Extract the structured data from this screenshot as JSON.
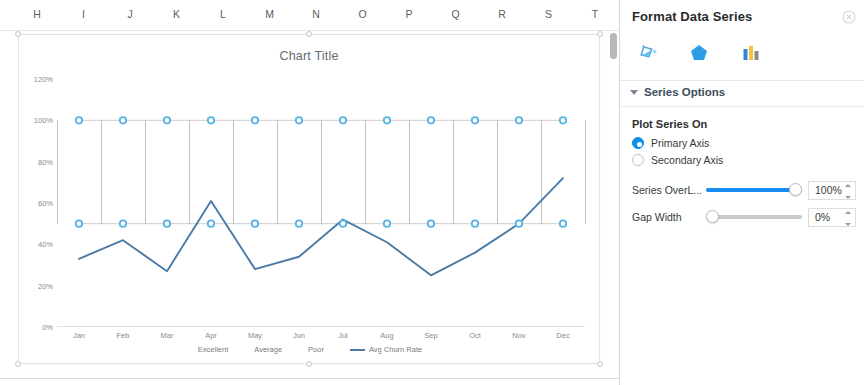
{
  "spreadsheet": {
    "column_headers": [
      "H",
      "I",
      "J",
      "K",
      "L",
      "M",
      "N",
      "O",
      "P",
      "Q",
      "R",
      "S",
      "T"
    ]
  },
  "chart_data": {
    "type": "line",
    "title": "Chart Title",
    "xlabel": "",
    "ylabel": "",
    "ylim": [
      0,
      120
    ],
    "ytick_labels": [
      "0%",
      "20%",
      "40%",
      "60%",
      "80%",
      "100%",
      "120%"
    ],
    "ytick_values": [
      0,
      20,
      40,
      60,
      80,
      100,
      120
    ],
    "categories": [
      "Jan",
      "Feb",
      "Mar",
      "Apr",
      "May",
      "Jun",
      "Jul",
      "Aug",
      "Sep",
      "Oct",
      "Nov",
      "Dec"
    ],
    "grid": false,
    "legend_position": "bottom",
    "series": [
      {
        "name": "Excellent",
        "type": "bar",
        "color": "#ffffff",
        "values": [
          0,
          0,
          0,
          0,
          0,
          0,
          0,
          0,
          0,
          0,
          0,
          0
        ]
      },
      {
        "name": "Average",
        "type": "bar",
        "color": "#ffffff",
        "values": [
          50,
          50,
          50,
          50,
          50,
          50,
          50,
          50,
          50,
          50,
          50,
          50
        ]
      },
      {
        "name": "Poor",
        "type": "bar",
        "color": "#ffffff",
        "values": [
          50,
          50,
          50,
          50,
          50,
          50,
          50,
          50,
          50,
          50,
          50,
          50
        ]
      },
      {
        "name": "Avg Churn Rate",
        "type": "line",
        "color": "#4a7ba6",
        "values": [
          33,
          42,
          27,
          61,
          28,
          34,
          52,
          41,
          25,
          36,
          50,
          72
        ]
      }
    ],
    "selection": {
      "selected_series": "Poor",
      "marker_color": "#56b3e8",
      "band_top": 100,
      "band_bottom": 50
    }
  },
  "panel": {
    "title": "Format Data Series",
    "close_icon": "close-icon",
    "icons": [
      {
        "name": "fill-and-line-icon",
        "label": "Fill & Line",
        "selected": false
      },
      {
        "name": "effects-icon",
        "label": "Effects",
        "selected": false
      },
      {
        "name": "series-options-icon",
        "label": "Series Options",
        "selected": true
      }
    ],
    "section": {
      "label": "Series Options",
      "expanded": true,
      "caret_icon": "chevron-down-icon"
    },
    "plot_series_on": {
      "label": "Plot Series On",
      "options": [
        {
          "label": "Primary Axis",
          "selected": true
        },
        {
          "label": "Secondary Axis",
          "selected": false
        }
      ]
    },
    "sliders": [
      {
        "label": "Series OverL...",
        "value": "100%",
        "percent": 100,
        "active": true
      },
      {
        "label": "Gap Width",
        "value": "0%",
        "percent": 0,
        "active": false
      }
    ]
  },
  "colors": {
    "accent": "#0b8fe8",
    "slider_fill": "#1a8cf0",
    "marker": "#56b3e8",
    "line": "#4a7ba6"
  }
}
